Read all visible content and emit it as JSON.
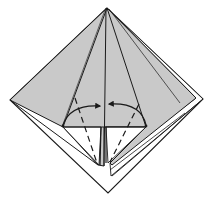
{
  "diagram": {
    "type": "origami-fold-instruction",
    "colors": {
      "paper_colored_side": "#c9c9c9",
      "paper_white_side": "#ffffff",
      "line": "#1a1a1a",
      "background": "#ffffff"
    },
    "elements": {
      "outer_square": "white paper square rotated 45 degrees (back layer)",
      "colored_flaps": "gray kite-shaped layers folded toward the center",
      "valley_fold_lines": 2,
      "fold_arrows": 2,
      "horizontal_crease": "line across the lower kite"
    }
  }
}
